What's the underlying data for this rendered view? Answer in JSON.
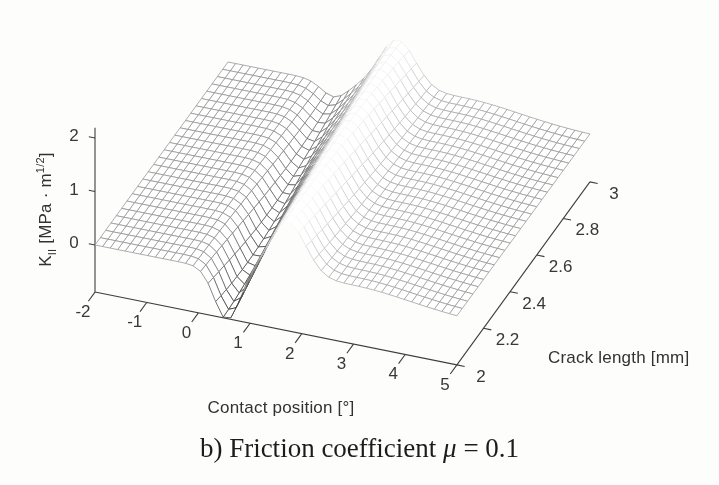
{
  "figure": {
    "caption": {
      "pre": "b) Friction coefficient ",
      "mu": "μ",
      "post": " = 0.1"
    }
  },
  "chart_data": {
    "type": "surface",
    "title": "",
    "xlabel": "Contact position [°]",
    "ylabel": "Crack length [mm]",
    "zlabel": {
      "base": "K",
      "sub": "II",
      "unit_pre": " [MPa · m",
      "sup": "1/2",
      "unit_post": "]"
    },
    "x_range": [
      -2,
      5
    ],
    "y_range": [
      2,
      3
    ],
    "z_axis_range": [
      -0.88,
      2.19
    ],
    "x_ticks": [
      "-2",
      "-1",
      "0",
      "1",
      "2",
      "3",
      "4",
      "5"
    ],
    "x_tick_values": [
      -2,
      -1,
      0,
      1,
      2,
      3,
      4,
      5
    ],
    "y_ticks": [
      "2",
      "2.2",
      "2.4",
      "2.6",
      "2.8",
      "3"
    ],
    "y_tick_values": [
      2,
      2.2,
      2.4,
      2.6,
      2.8,
      3
    ],
    "z_ticks": [
      "0",
      "1",
      "2"
    ],
    "z_tick_values": [
      0,
      1,
      2
    ],
    "baseline_z": 0,
    "surface_model": {
      "description": "K_II is ~0 away from the contact zone; a sharp negative trough followed by a sharp positive peak occurs near contact position 0–2°; the trough/peak pair shifts to smaller contact positions and the trough becomes shallower as crack length increases from 2 to 3 mm",
      "peak": {
        "x_at_front": 1.72,
        "x_at_back": 1.27,
        "amp_at_front": 1.05,
        "amp_at_back": 0.95,
        "width": 0.5
      },
      "valley": {
        "x_at_front": 0.55,
        "x_at_back": 0.05,
        "depth_at_front": 0.92,
        "depth_at_back": 0.27,
        "width": 0.34
      },
      "shoulder": {
        "amp": 0.22,
        "offset_from_peak": 1.3,
        "width": 1.5
      }
    },
    "grid": {
      "nx": 49,
      "ny": 26
    },
    "layout": {
      "projection": {
        "origin_px": [
          95,
          245
        ],
        "ex_px": [
          51.7,
          10.4
        ],
        "ey_px": [
          133,
          -183
        ],
        "ez_px": [
          0,
          -53.5
        ]
      },
      "colors": {
        "background": "#fdfdfc",
        "axis": "#3f3f3f",
        "text": "#323232",
        "face": "#ffffff"
      },
      "tick_label_offsets": {
        "x": [
          -12,
          20
        ],
        "y": [
          24,
          12
        ],
        "z": [
          -21,
          -2
        ]
      },
      "grid_on": true,
      "legend": false
    }
  }
}
